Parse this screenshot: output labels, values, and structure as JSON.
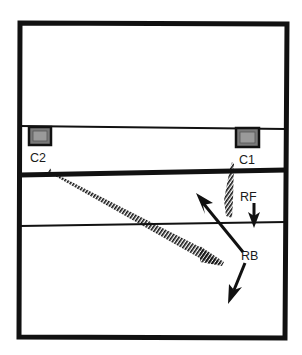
{
  "diagram": {
    "type": "court-positions",
    "colors": {
      "ink": "#111111",
      "paper": "#ffffff",
      "marker_fill": "#7a7a7a"
    },
    "markers": [
      {
        "id": "C2",
        "label": "C2"
      },
      {
        "id": "C1",
        "label": "C1"
      }
    ],
    "players": [
      {
        "id": "RF",
        "label": "RF"
      },
      {
        "id": "RB",
        "label": "RB"
      }
    ],
    "paths": [
      {
        "from": "C2",
        "style": "hatched",
        "description": "hatched trajectory from C2 toward RB"
      },
      {
        "from": "C1",
        "style": "hatched",
        "description": "hatched trajectory from C1 down toward RF"
      }
    ],
    "arrows": [
      {
        "from": "RB",
        "direction": "up-left",
        "style": "solid"
      },
      {
        "from": "RF",
        "direction": "down",
        "style": "solid"
      },
      {
        "from": "RB",
        "direction": "down-left",
        "style": "solid"
      }
    ]
  }
}
